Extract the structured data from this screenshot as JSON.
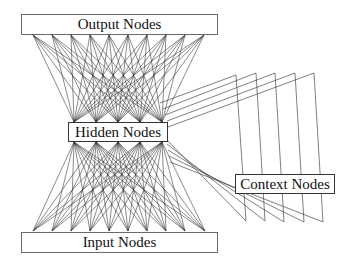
{
  "diagram": {
    "layers": {
      "output": {
        "label": "Output Nodes",
        "count": 10
      },
      "hidden": {
        "label": "Hidden Nodes",
        "count": 5
      },
      "input": {
        "label": "Input Nodes",
        "count": 10
      },
      "context": {
        "label": "Context Nodes",
        "count": 5
      }
    },
    "colors": {
      "line": "#2a2a2a",
      "box_border": "#555555",
      "background": "#ffffff"
    }
  },
  "geometry": {
    "output_points_x": [
      33,
      52,
      71,
      90,
      109,
      128,
      147,
      166,
      185,
      204
    ],
    "output_y": 35,
    "input_points_x": [
      33,
      52,
      71,
      90,
      109,
      128,
      147,
      166,
      185,
      205
    ],
    "input_y": 231,
    "hidden_points_x": [
      74,
      96,
      118,
      140,
      162
    ],
    "hidden_top_y": 122,
    "hidden_bottom_y": 142,
    "context_feedback": [
      {
        "from": [
          160,
          103
        ],
        "peak": [
          236,
          75
        ],
        "bottom": [
          246,
          221
        ],
        "back": [
          166,
          139
        ]
      },
      {
        "from": [
          163,
          109
        ],
        "peak": [
          256,
          73
        ],
        "bottom": [
          265,
          221
        ],
        "back": [
          167,
          144
        ]
      },
      {
        "from": [
          165,
          115
        ],
        "peak": [
          275,
          73
        ],
        "bottom": [
          284,
          222
        ],
        "back": [
          168,
          150
        ]
      },
      {
        "from": [
          167,
          121
        ],
        "peak": [
          295,
          73
        ],
        "bottom": [
          304,
          222
        ],
        "back": [
          169,
          156
        ]
      },
      {
        "from": [
          168,
          127
        ],
        "peak": [
          314,
          73
        ],
        "bottom": [
          323,
          222
        ],
        "back": [
          170,
          162
        ]
      }
    ]
  }
}
